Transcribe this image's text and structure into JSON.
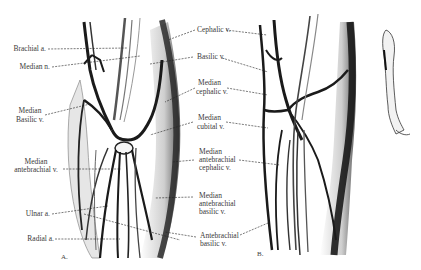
{
  "figure": {
    "panels": [
      {
        "id": "A",
        "label": "A."
      },
      {
        "id": "B",
        "label": "B."
      }
    ],
    "left_labels": [
      {
        "id": "brachial-a",
        "text": "Brachial a."
      },
      {
        "id": "median-n",
        "text": "Median n."
      },
      {
        "id": "median-basilic-v-1",
        "text": "Median"
      },
      {
        "id": "median-basilic-v-2",
        "text": "Basilic v."
      },
      {
        "id": "median-antebrachial-v-1",
        "text": "Median"
      },
      {
        "id": "median-antebrachial-v-2",
        "text": "antebrachial v."
      },
      {
        "id": "ulnar-a",
        "text": "Ulnar a."
      },
      {
        "id": "radial-a",
        "text": "Radial a."
      }
    ],
    "center_labels": [
      {
        "id": "cephalic-v",
        "text": "Cephalic v."
      },
      {
        "id": "basilic-v",
        "text": "Basilic v."
      },
      {
        "id": "median-cephalic-v-1",
        "text": "Median"
      },
      {
        "id": "median-cephalic-v-2",
        "text": "cephalic v."
      },
      {
        "id": "median-cubital-v-1",
        "text": "Median"
      },
      {
        "id": "median-cubital-v-2",
        "text": "cubital v."
      },
      {
        "id": "median-antebrachial-cephalic-v-1",
        "text": "Median"
      },
      {
        "id": "median-antebrachial-cephalic-v-2",
        "text": "antebrachial"
      },
      {
        "id": "median-antebrachial-cephalic-v-3",
        "text": "cephalic v."
      },
      {
        "id": "median-antebrachial-basilic-v-1",
        "text": "Median"
      },
      {
        "id": "median-antebrachial-basilic-v-2",
        "text": "antebrachial"
      },
      {
        "id": "median-antebrachial-basilic-v-3",
        "text": "basilic v."
      },
      {
        "id": "antebrachial-basilic-v-1",
        "text": "Antebrachial"
      },
      {
        "id": "antebrachial-basilic-v-2",
        "text": "basilic v."
      }
    ],
    "colors": {
      "background": "#ffffff",
      "ink": "#1a1a1a",
      "shade": "#8a8a8a",
      "label": "#3a3a3a"
    }
  }
}
